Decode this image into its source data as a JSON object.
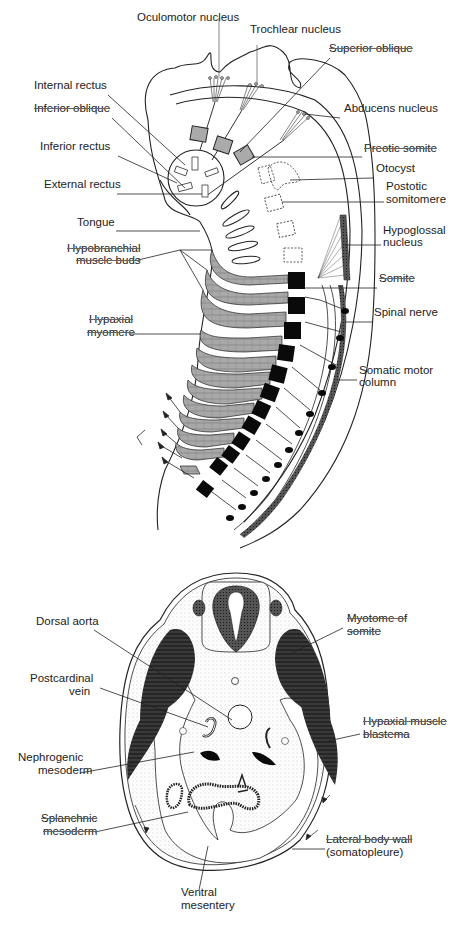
{
  "figure": {
    "top_panel": {
      "title": "Embryo head and trunk, lateral view (somitic muscle origins)",
      "labels": [
        {
          "id": "oculomotor",
          "text": "Oculomotor nucleus",
          "x": 137,
          "y": 21
        },
        {
          "id": "trochlear",
          "text": "Trochlear nucleus",
          "x": 250,
          "y": 33
        },
        {
          "id": "sup_oblique",
          "text": "Superior oblique",
          "x": 329,
          "y": 52,
          "strike": true
        },
        {
          "id": "internal_rectus",
          "text": "Internal rectus",
          "x": 34,
          "y": 89
        },
        {
          "id": "abducens",
          "text": "Abducens nucleus",
          "x": 344,
          "y": 112
        },
        {
          "id": "inferior_oblique",
          "text": "Inferior oblique",
          "x": 34,
          "y": 112,
          "strike": true
        },
        {
          "id": "inferior_rectus",
          "text": "Inferior rectus",
          "x": 40,
          "y": 150
        },
        {
          "id": "preotic",
          "text": "Preotic somite",
          "x": 364,
          "y": 152,
          "strike": true
        },
        {
          "id": "otocyst",
          "text": "Otocyst",
          "x": 376,
          "y": 172
        },
        {
          "id": "external_rectus",
          "text": "External rectus",
          "x": 44,
          "y": 188
        },
        {
          "id": "postotic1",
          "text": "Postotic",
          "x": 386,
          "y": 190
        },
        {
          "id": "postotic2",
          "text": "somitomere",
          "x": 386,
          "y": 203
        },
        {
          "id": "tongue",
          "text": "Tongue",
          "x": 77,
          "y": 226
        },
        {
          "id": "hypoglossal1",
          "text": "Hypoglossal",
          "x": 383,
          "y": 234
        },
        {
          "id": "hypoglossal2",
          "text": "nucleus",
          "x": 383,
          "y": 246
        },
        {
          "id": "hypobranchial1",
          "text": "Hypobranchial",
          "x": 67,
          "y": 252,
          "strike": true
        },
        {
          "id": "hypobranchial2",
          "text": "muscle buds",
          "x": 76,
          "y": 264,
          "strike": true
        },
        {
          "id": "somite",
          "text": "Somite",
          "x": 379,
          "y": 282,
          "strike": true
        },
        {
          "id": "spinal_nerve",
          "text": "Spinal nerve",
          "x": 374,
          "y": 316
        },
        {
          "id": "hypaxial_myomere1",
          "text": "Hypaxial",
          "x": 89,
          "y": 323,
          "strike": true
        },
        {
          "id": "hypaxial_myomere2",
          "text": "myomere",
          "x": 87,
          "y": 336,
          "strike": true
        },
        {
          "id": "somatic_motor1",
          "text": "Somatic motor",
          "x": 359,
          "y": 374
        },
        {
          "id": "somatic_motor2",
          "text": "column",
          "x": 359,
          "y": 386
        }
      ]
    },
    "bottom_panel": {
      "title": "Embryo trunk, transverse section",
      "labels": [
        {
          "id": "dorsal_aorta",
          "text": "Dorsal aorta",
          "x": 36,
          "y": 625
        },
        {
          "id": "myotome1",
          "text": "Myotome of",
          "x": 347,
          "y": 622,
          "strike": true
        },
        {
          "id": "myotome2",
          "text": "somite",
          "x": 347,
          "y": 635,
          "strike": true
        },
        {
          "id": "postcardinal1",
          "text": "Postcardinal",
          "x": 30,
          "y": 682
        },
        {
          "id": "postcardinal2",
          "text": "vein",
          "x": 69,
          "y": 695
        },
        {
          "id": "hypaxial_blastema1",
          "text": "Hypaxial muscle",
          "x": 363,
          "y": 725,
          "strike": true
        },
        {
          "id": "hypaxial_blastema2",
          "text": "blastema",
          "x": 363,
          "y": 738,
          "strike": true
        },
        {
          "id": "nephrogenic1",
          "text": "Nephrogenic",
          "x": 18,
          "y": 761
        },
        {
          "id": "nephrogenic2",
          "text": "mesoderm",
          "x": 38,
          "y": 774
        },
        {
          "id": "splanchnic1",
          "text": "Splanchnic",
          "x": 41,
          "y": 822,
          "strike": true
        },
        {
          "id": "splanchnic2",
          "text": "mesoderm",
          "x": 43,
          "y": 835,
          "strike": true
        },
        {
          "id": "lateral_wall1",
          "text": "Lateral body wall",
          "x": 326,
          "y": 843,
          "strike": true
        },
        {
          "id": "lateral_wall2",
          "text": "(somatopleure)",
          "x": 326,
          "y": 856
        },
        {
          "id": "ventral1",
          "text": "Ventral",
          "x": 181,
          "y": 896
        },
        {
          "id": "ventral2",
          "text": "mesentery",
          "x": 181,
          "y": 909
        }
      ]
    },
    "colors": {
      "line": "#222222",
      "muscle_gray": "#a8a8a8",
      "somite_black": "#0a0a0a",
      "myotome_dark": "#3a3a3a",
      "stipple": "#d9d9d9"
    }
  }
}
